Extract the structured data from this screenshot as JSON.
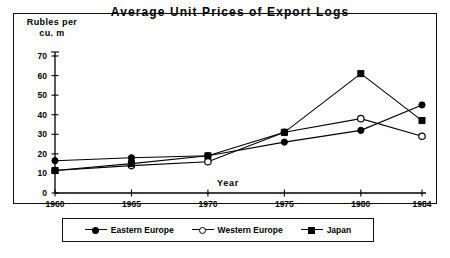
{
  "figure": {
    "title": "Average Unit Prices of Export Logs",
    "y_axis_title_line1": "Rubles  per",
    "y_axis_title_line2": "cu.  m",
    "x_inline_label": "Year"
  },
  "legend": {
    "position": "bottom-center",
    "entries": [
      {
        "label": "Eastern Europe",
        "marker": "filled-circle"
      },
      {
        "label": "Western Europe",
        "marker": "open-circle"
      },
      {
        "label": "Japan",
        "marker": "filled-square"
      }
    ]
  },
  "axis": {
    "y_ticks": [
      "0",
      "10",
      "20",
      "30",
      "40",
      "50",
      "60",
      "70"
    ],
    "x_ticks": [
      "1960",
      "1965",
      "1970",
      "1975",
      "1980",
      "1984"
    ]
  },
  "chart_data": {
    "type": "line",
    "title": "Average Unit Prices of Export Logs",
    "xlabel": "Year",
    "ylabel": "Rubles per cu. m",
    "x": [
      1960,
      1965,
      1970,
      1975,
      1980,
      1984
    ],
    "xlim": [
      1960,
      1984
    ],
    "ylim": [
      0,
      70
    ],
    "ytick_step": 10,
    "grid": false,
    "legend": "bottom-center",
    "series": [
      {
        "name": "Eastern Europe",
        "marker": "filled-circle",
        "values": [
          16.5,
          18.0,
          19.0,
          26.0,
          32.0,
          45.0
        ]
      },
      {
        "name": "Western Europe",
        "marker": "open-circle",
        "values": [
          11.5,
          14.0,
          16.0,
          31.0,
          38.0,
          29.0
        ]
      },
      {
        "name": "Japan",
        "marker": "filled-square",
        "values": [
          11.5,
          15.0,
          19.0,
          31.0,
          61.0,
          37.0
        ]
      }
    ]
  }
}
